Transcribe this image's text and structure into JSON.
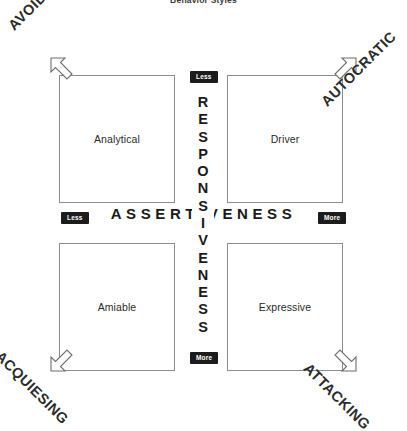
{
  "title": "Behavior Styles",
  "chart_data": {
    "type": "table",
    "title": "Behavior Styles",
    "xlabel": "ASSERTIVENESS",
    "ylabel": "RESPONSIVENESS",
    "x_axis": {
      "label": "ASSERTIVENESS",
      "low_marker": "Less",
      "high_marker": "More",
      "orientation": "horizontal"
    },
    "y_axis": {
      "label": "RESPONSIVENESS",
      "low_marker": "Less",
      "high_marker": "More",
      "orientation": "vertical"
    },
    "quadrants": [
      {
        "name": "Analytical",
        "position": "top-left",
        "assertiveness": "Less",
        "responsiveness": "Less"
      },
      {
        "name": "Driver",
        "position": "top-right",
        "assertiveness": "More",
        "responsiveness": "Less"
      },
      {
        "name": "Amiable",
        "position": "bottom-left",
        "assertiveness": "Less",
        "responsiveness": "More"
      },
      {
        "name": "Expressive",
        "position": "bottom-right",
        "assertiveness": "More",
        "responsiveness": "More"
      }
    ],
    "corner_labels": [
      {
        "text": "AVOIDING",
        "position": "top-left",
        "arrow": "up-left"
      },
      {
        "text": "AUTOCRATIC",
        "position": "top-right",
        "arrow": "up-right"
      },
      {
        "text": "ACQUIESING",
        "position": "bottom-left",
        "arrow": "down-left"
      },
      {
        "text": "ATTACKING",
        "position": "bottom-right",
        "arrow": "down-right"
      }
    ],
    "grid": false,
    "legend": "none"
  },
  "quadrants": {
    "analytical": "Analytical",
    "driver": "Driver",
    "amiable": "Amiable",
    "expressive": "Expressive"
  },
  "axes": {
    "horizontal_label": "ASSERTIVENESS",
    "vertical_label": "RESPONSIVENESS",
    "vertical_letters": [
      "R",
      "E",
      "S",
      "P",
      "O",
      "N",
      "S",
      "I",
      "V",
      "E",
      "N",
      "E",
      "S",
      "S"
    ],
    "badges": {
      "vertical_top": "Less",
      "vertical_bottom": "More",
      "horizontal_left": "Less",
      "horizontal_right": "More"
    }
  },
  "corners": {
    "top_left": "AVOIDING",
    "top_right": "AUTOCRATIC",
    "bottom_left": "ACQUIESING",
    "bottom_right": "ATTACKING"
  },
  "colors": {
    "badge_background": "#1c1c1c",
    "badge_text": "#ffffff",
    "box_border": "#8d8d8d",
    "arrow_stroke": "#6f6f6f",
    "text": "#231f20",
    "background": "#ffffff"
  }
}
